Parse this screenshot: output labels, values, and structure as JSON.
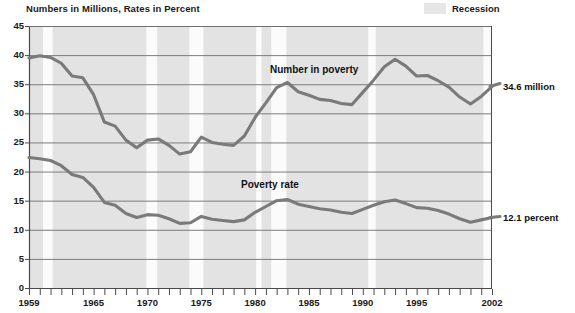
{
  "subtitle": "Numbers in Millions, Rates in Percent",
  "legend": {
    "items": [
      {
        "label": "Recession",
        "color": "#e6e6e6"
      }
    ]
  },
  "annotations": {
    "number_series_label": "Number in poverty",
    "rate_series_label": "Poverty rate",
    "number_endpoint": "34.6 million",
    "rate_endpoint": "12.1 percent"
  },
  "colors": {
    "plot_background": "#e3e3e3",
    "recession_band": "#fbfbfb",
    "gridline": "#6f6f6f",
    "axis": "#4a4a4a",
    "line": "#7a7a7a",
    "text": "#1a1a1a"
  },
  "chart_data": {
    "type": "line",
    "title": "",
    "subtitle": "Numbers in Millions, Rates in Percent",
    "xlabel": "",
    "ylabel": "",
    "xlim": [
      1959,
      2002
    ],
    "ylim": [
      0,
      45
    ],
    "yticks": [
      0,
      5,
      10,
      15,
      20,
      25,
      30,
      35,
      40,
      45
    ],
    "xticks": [
      1959,
      1965,
      1970,
      1975,
      1980,
      1985,
      1990,
      1995,
      2002
    ],
    "x_tick_interval_years": 1,
    "grid": true,
    "legend_position": "top-right",
    "x": [
      1959,
      1960,
      1961,
      1962,
      1963,
      1964,
      1965,
      1966,
      1967,
      1968,
      1969,
      1970,
      1971,
      1972,
      1973,
      1974,
      1975,
      1976,
      1977,
      1978,
      1979,
      1980,
      1981,
      1982,
      1983,
      1984,
      1985,
      1986,
      1987,
      1988,
      1989,
      1990,
      1991,
      1992,
      1993,
      1994,
      1995,
      1996,
      1997,
      1998,
      1999,
      2000,
      2001,
      2002
    ],
    "series": [
      {
        "name": "Number in poverty",
        "unit": "millions",
        "values": [
          39.5,
          39.9,
          39.6,
          38.6,
          36.4,
          36.1,
          33.2,
          28.5,
          27.8,
          25.4,
          24.1,
          25.4,
          25.6,
          24.5,
          23.0,
          23.4,
          25.9,
          25.0,
          24.7,
          24.5,
          26.1,
          29.3,
          31.8,
          34.4,
          35.3,
          33.7,
          33.1,
          32.4,
          32.2,
          31.7,
          31.5,
          33.6,
          35.7,
          38.0,
          39.3,
          38.1,
          36.4,
          36.5,
          35.6,
          34.5,
          32.8,
          31.6,
          32.9,
          34.6
        ]
      },
      {
        "name": "Poverty rate",
        "unit": "percent",
        "values": [
          22.4,
          22.2,
          21.9,
          21.0,
          19.5,
          19.0,
          17.3,
          14.7,
          14.2,
          12.8,
          12.1,
          12.6,
          12.5,
          11.9,
          11.1,
          11.2,
          12.3,
          11.8,
          11.6,
          11.4,
          11.7,
          13.0,
          14.0,
          15.0,
          15.2,
          14.4,
          14.0,
          13.6,
          13.4,
          13.0,
          12.8,
          13.5,
          14.2,
          14.8,
          15.1,
          14.5,
          13.8,
          13.7,
          13.3,
          12.7,
          11.9,
          11.3,
          11.7,
          12.1
        ]
      }
    ],
    "recession_bands": [
      {
        "start": 1960.3,
        "end": 1961.2
      },
      {
        "start": 1969.9,
        "end": 1970.9
      },
      {
        "start": 1973.9,
        "end": 1975.2
      },
      {
        "start": 1980.1,
        "end": 1980.6
      },
      {
        "start": 1981.5,
        "end": 1982.9
      },
      {
        "start": 1990.5,
        "end": 1991.2
      },
      {
        "start": 2001.2,
        "end": 2001.9
      }
    ]
  }
}
